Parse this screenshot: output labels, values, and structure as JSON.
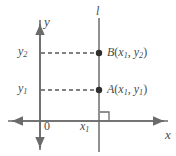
{
  "figure": {
    "background_color": "#ffffff",
    "stroke_color": "#6b6b6b",
    "text_color": "#4a4a4a",
    "width": 176,
    "height": 156
  },
  "axes": {
    "x_axis_label": "x",
    "y_axis_label": "y",
    "origin_label": "0",
    "x_axis_y_px": 121,
    "y_axis_x_px": 40,
    "x_axis_left_px": 8,
    "x_axis_right_px": 168,
    "y_axis_top_px": 20,
    "y_axis_bottom_px": 150,
    "arrows": [
      "left",
      "right",
      "up",
      "down"
    ]
  },
  "vertical_line": {
    "label": "l",
    "x_px": 99,
    "top_px": 18,
    "bottom_px": 152
  },
  "ticks": {
    "y2_label": "y",
    "y2_sub": "2",
    "y2_value_px": 53,
    "y1_label": "y",
    "y1_sub": "1",
    "y1_value_px": 90,
    "x1_label": "x",
    "x1_sub": "1"
  },
  "points": [
    {
      "name": "B",
      "label_prefix": "B",
      "label_open": "(",
      "coord_x": "x",
      "coord_x_sub": "1",
      "comma": ", ",
      "coord_y": "y",
      "coord_y_sub": "2",
      "label_close": ")",
      "cx_px": 99,
      "cy_px": 53
    },
    {
      "name": "A",
      "label_prefix": "A",
      "label_open": "(",
      "coord_x": "x",
      "coord_x_sub": "1",
      "comma": ", ",
      "coord_y": "y",
      "coord_y_sub": "1",
      "label_close": ")",
      "cx_px": 99,
      "cy_px": 90
    }
  ],
  "dashed_guides": [
    {
      "name": "guide-to-B",
      "from_x_px": 41,
      "to_x_px": 98,
      "y_px": 53
    },
    {
      "name": "guide-to-A",
      "from_x_px": 41,
      "to_x_px": 98,
      "y_px": 90
    }
  ],
  "right_angle_marker": {
    "name": "right-angle-at-x1",
    "x_px": 100,
    "y_px": 112,
    "size_px": 9
  }
}
